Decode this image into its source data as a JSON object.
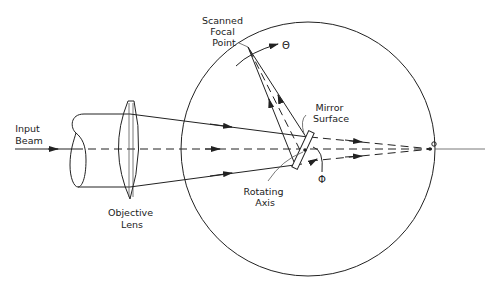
{
  "diagram": {
    "labels": {
      "input_beam": [
        "Input",
        "Beam"
      ],
      "objective_lens": [
        "Objective",
        "Lens"
      ],
      "scanned_focal_point": [
        "Scanned",
        "Focal",
        "Point"
      ],
      "mirror_surface": [
        "Mirror",
        "Surface"
      ],
      "rotating_axis": [
        "Rotating",
        "Axis"
      ],
      "theta": "Θ",
      "phi": "Φ",
      "focal_point": "o"
    },
    "colors": {
      "ink": "#222222",
      "background": "#ffffff"
    }
  }
}
